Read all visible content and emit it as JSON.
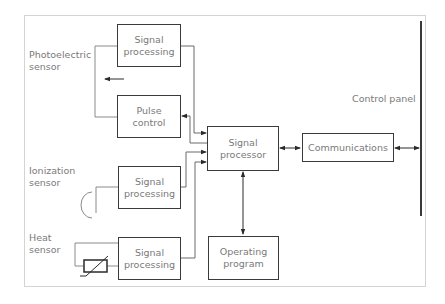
{
  "diagram": {
    "type": "block-diagram",
    "sensors": {
      "photoelectric": "Photoelectric\nsensor",
      "ionization": "Ionization\nsensor",
      "heat": "Heat\nsensor"
    },
    "blocks": {
      "signal_processing_1": "Signal\nprocessing",
      "pulse_control": "Pulse\ncontrol",
      "signal_processing_2": "Signal\nprocessing",
      "signal_processing_3": "Signal\nprocessing",
      "signal_processor": "Signal\nprocessor",
      "communications": "Communications",
      "operating_program": "Operating\nprogram"
    },
    "control_panel_label": "Control panel",
    "edges": [
      {
        "from": "photoelectric",
        "to": "signal_processing_1"
      },
      {
        "from": "pulse_control",
        "to": "photoelectric"
      },
      {
        "from": "signal_processing_1",
        "to": "signal_processor"
      },
      {
        "from": "signal_processor",
        "to": "pulse_control"
      },
      {
        "from": "ionization",
        "to": "signal_processing_2"
      },
      {
        "from": "signal_processing_2",
        "to": "signal_processor"
      },
      {
        "from": "heat",
        "to": "signal_processing_3"
      },
      {
        "from": "signal_processing_3",
        "to": "signal_processor"
      },
      {
        "from": "signal_processor",
        "to": "communications",
        "bidirectional": true
      },
      {
        "from": "communications",
        "to": "control_panel",
        "bidirectional": true
      },
      {
        "from": "signal_processor",
        "to": "operating_program",
        "bidirectional": true
      }
    ]
  }
}
